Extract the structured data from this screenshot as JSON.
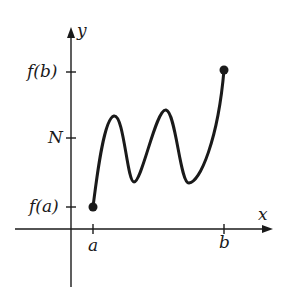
{
  "diagram": {
    "type": "function-graph",
    "axes": {
      "x_label": "x",
      "y_label": "y"
    },
    "x_ticks": [
      {
        "label": "a",
        "px": 93
      },
      {
        "label": "b",
        "px": 224
      }
    ],
    "y_ticks": [
      {
        "label": "f(b)",
        "px": 72
      },
      {
        "label": "N",
        "px": 138
      },
      {
        "label": "f(a)",
        "px": 207
      }
    ],
    "points": [
      {
        "name": "start",
        "label": "(a, f(a))",
        "x": 93,
        "y": 207,
        "filled": true
      },
      {
        "name": "end",
        "label": "(b, f(b))",
        "x": 224,
        "y": 70,
        "filled": true
      }
    ],
    "colors": {
      "ink": "#1a1a1a",
      "background": "#ffffff"
    }
  }
}
